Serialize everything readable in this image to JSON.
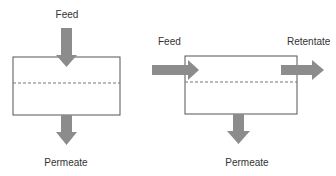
{
  "diagrams": [
    {
      "name": "dead-end-filtration",
      "labels": {
        "feed": "Feed",
        "permeate": "Permeate"
      }
    },
    {
      "name": "cross-flow-filtration",
      "labels": {
        "feed": "Feed",
        "retentate": "Retentate",
        "permeate": "Permeate"
      }
    }
  ],
  "colors": {
    "arrow": "#8c8c8c",
    "box_stroke": "#555555",
    "membrane": "#777777",
    "text": "#333333"
  }
}
